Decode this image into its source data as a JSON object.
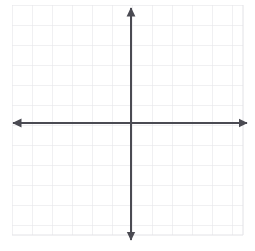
{
  "figure": {
    "name": "blank-coordinate-plane",
    "title": "",
    "width": 255,
    "height": 251,
    "background_color": "#ffffff"
  },
  "chart_data": {
    "type": "scatter",
    "title": "",
    "subtitle": "",
    "xlabel": "",
    "ylabel": "",
    "x": [],
    "y": [],
    "series": [],
    "annotations": [],
    "legend": {
      "visible": false,
      "position": "none",
      "entries": []
    },
    "grid": {
      "visible": true,
      "color": "#e2e2e6",
      "minor_color": "#eeeef1",
      "cell_size_px": 20,
      "columns": 11,
      "rows": 11,
      "left_px": 12,
      "top_px": 5,
      "right_px": 243,
      "bottom_px": 235
    },
    "axes": {
      "color": "#4a4a52",
      "line_width_px": 2,
      "origin_px": {
        "x": 131,
        "y": 123
      },
      "x_axis": {
        "visible": true,
        "start_px": 13,
        "end_px": 247,
        "arrow_start": true,
        "arrow_end": true,
        "tick_labels": [],
        "ticks_visible": false
      },
      "y_axis": {
        "visible": true,
        "start_px": 8,
        "end_px": 240,
        "arrow_start": true,
        "arrow_end": true,
        "tick_labels": [],
        "ticks_visible": false
      },
      "xlim": [
        -6,
        6
      ],
      "ylim": [
        -6,
        6
      ]
    }
  }
}
